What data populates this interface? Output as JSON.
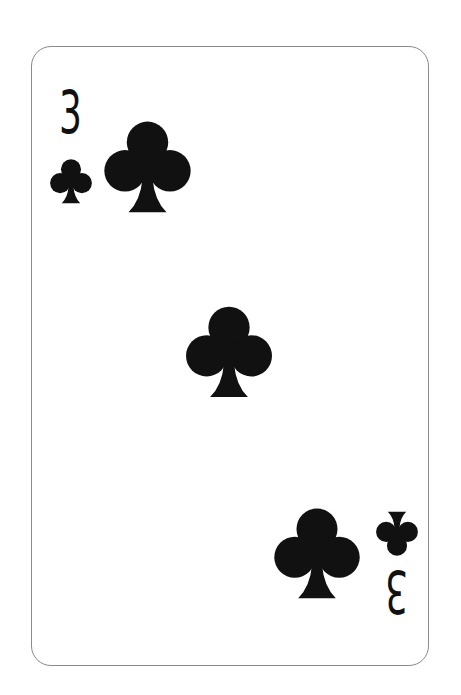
{
  "card": {
    "rank": "3",
    "suit": "clubs",
    "suit_icon": "club-icon",
    "ink_color": "#111111",
    "border_color": "#8a8a8a",
    "background_color": "#ffffff",
    "pip_count": 3
  },
  "corners": {
    "top_left": {
      "rank": "3",
      "suit": "clubs"
    },
    "bottom_right": {
      "rank": "3",
      "suit": "clubs",
      "rotated": true
    }
  }
}
